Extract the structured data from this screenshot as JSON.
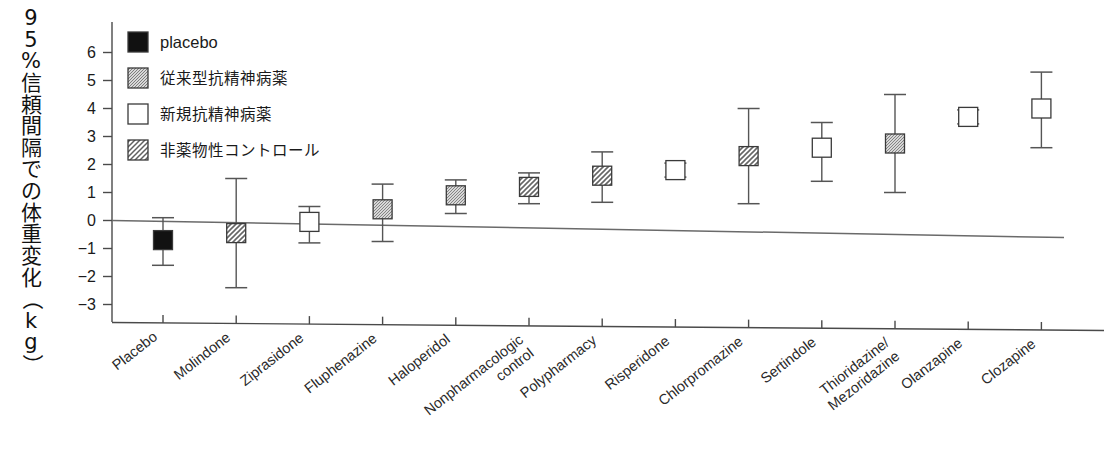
{
  "chart_data": {
    "type": "scatter",
    "title": "",
    "ylabel": "95%信頼間隔での体重変化（kg）",
    "xlabel": "",
    "ylim": [
      -3.4,
      6.6
    ],
    "yticks": [
      6,
      5,
      4,
      3,
      2,
      1,
      0,
      -1,
      -2,
      -3
    ],
    "ytick_labels": [
      "6",
      "5",
      "4",
      "3",
      "2",
      "1",
      "0",
      "−1",
      "−2",
      "−3"
    ],
    "grid": false,
    "zero_reference_line": true,
    "legend_position": "top-left",
    "legend": [
      {
        "label": "placebo",
        "style": "filled-black",
        "script": "latin"
      },
      {
        "label": "従来型抗精神病薬",
        "style": "fine-hatch",
        "script": "japanese"
      },
      {
        "label": "新規抗精神病薬",
        "style": "open-white",
        "script": "japanese"
      },
      {
        "label": "非薬物性コントロール",
        "style": "diagonal-hatch",
        "script": "japanese"
      }
    ],
    "categories": [
      "Placebo",
      "Molindone",
      "Ziprasidone",
      "Fluphenazine",
      "Haloperidol",
      "Nonpharmacologic control",
      "Polypharmacy",
      "Risperidone",
      "Chlorpromazine",
      "Sertindole",
      "Thioridazine/ Mezoridazine",
      "Olanzapine",
      "Clozapine"
    ],
    "category_label_lines": [
      [
        "Placebo"
      ],
      [
        "Molindone"
      ],
      [
        "Ziprasidone"
      ],
      [
        "Fluphenazine"
      ],
      [
        "Haloperidol"
      ],
      [
        "Nonpharmacologic",
        "control"
      ],
      [
        "Polypharmacy"
      ],
      [
        "Risperidone"
      ],
      [
        "Chlorpromazine"
      ],
      [
        "Sertindole"
      ],
      [
        "Thioridazine/",
        "Mezoridazine"
      ],
      [
        "Olanzapine"
      ],
      [
        "Clozapine"
      ]
    ],
    "values": [
      -0.7,
      -0.45,
      -0.05,
      0.4,
      0.9,
      1.2,
      1.6,
      1.8,
      2.3,
      2.6,
      2.75,
      3.7,
      4.0
    ],
    "ci_low": [
      -1.6,
      -2.4,
      -0.8,
      -0.75,
      0.25,
      0.6,
      0.65,
      1.55,
      0.6,
      1.4,
      1.0,
      3.45,
      2.6
    ],
    "ci_high": [
      0.1,
      1.5,
      0.5,
      1.3,
      1.45,
      1.7,
      2.45,
      2.05,
      4.0,
      3.5,
      4.5,
      3.95,
      5.3
    ],
    "marker_styles": [
      "filled-black",
      "diagonal-hatch",
      "open-white",
      "fine-hatch",
      "fine-hatch",
      "diagonal-hatch",
      "diagonal-hatch",
      "open-white",
      "diagonal-hatch",
      "open-white",
      "fine-hatch",
      "open-white",
      "open-white"
    ]
  },
  "colors": {
    "axis": "#4a4a4a",
    "marker_fill_black": "#111111",
    "marker_open": "#ffffff",
    "hatch_stroke": "#666666",
    "text": "#1a1a1a"
  }
}
